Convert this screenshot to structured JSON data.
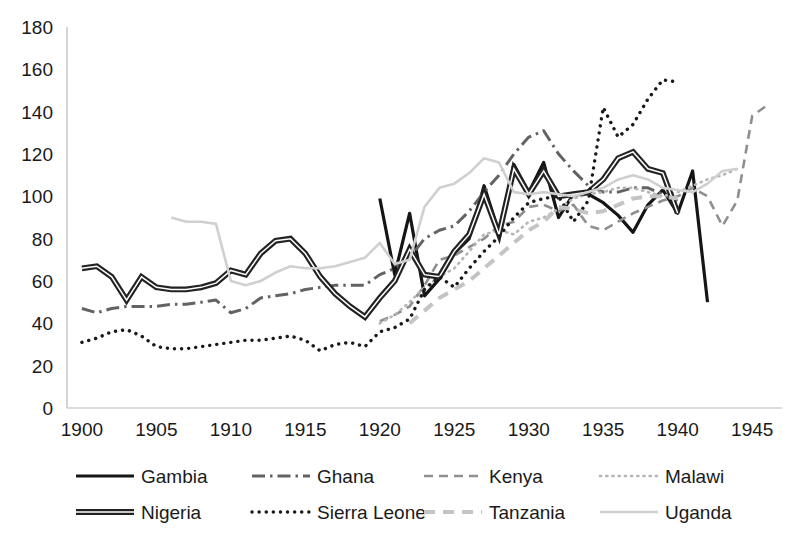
{
  "chart_data": {
    "type": "line",
    "title": "",
    "xlabel": "",
    "ylabel": "",
    "xlim": [
      1899,
      1947
    ],
    "ylim": [
      0,
      180
    ],
    "grid": false,
    "legend_position": "bottom",
    "x_ticks": [
      "1900",
      "1905",
      "1910",
      "1915",
      "1920",
      "1925",
      "1930",
      "1935",
      "1940",
      "1945"
    ],
    "y_ticks": [
      "0",
      "20",
      "40",
      "60",
      "80",
      "100",
      "120",
      "140",
      "160",
      "180"
    ],
    "series": [
      {
        "name": "Gambia",
        "style": "solid",
        "color": "#151515",
        "width": 3.2,
        "x": [
          1920,
          1921,
          1922,
          1923,
          1924,
          1925,
          1926,
          1927,
          1928,
          1929,
          1930,
          1931,
          1932,
          1933,
          1934,
          1935,
          1936,
          1937,
          1938,
          1939,
          1940,
          1941,
          1942
        ],
        "y": [
          99,
          63,
          92,
          53,
          61,
          73,
          80,
          105,
          83,
          115,
          102,
          116,
          90,
          101,
          101,
          97,
          91,
          83,
          96,
          103,
          92,
          112,
          50
        ]
      },
      {
        "name": "Ghana",
        "style": "dash-dot",
        "color": "#636363",
        "width": 3.0,
        "x": [
          1900,
          1901,
          1902,
          1903,
          1904,
          1905,
          1906,
          1907,
          1908,
          1909,
          1910,
          1911,
          1912,
          1913,
          1914,
          1915,
          1916,
          1917,
          1918,
          1919,
          1920,
          1921,
          1922,
          1923,
          1924,
          1925,
          1926,
          1927,
          1928,
          1929,
          1930,
          1931,
          1932,
          1933,
          1934,
          1935,
          1936,
          1937,
          1938,
          1939,
          1940
        ],
        "y": [
          47,
          45,
          47,
          48,
          48,
          48,
          49,
          49,
          50,
          51,
          45,
          47,
          52,
          53,
          54,
          56,
          57,
          58,
          58,
          58,
          63,
          66,
          71,
          80,
          84,
          86,
          93,
          102,
          110,
          120,
          128,
          131,
          120,
          112,
          105,
          102,
          102,
          104,
          104,
          101,
          98
        ]
      },
      {
        "name": "Kenya",
        "style": "dashed",
        "color": "#8f8f8f",
        "width": 2.6,
        "x": [
          1920,
          1921,
          1922,
          1923,
          1924,
          1925,
          1926,
          1927,
          1928,
          1929,
          1930,
          1931,
          1932,
          1933,
          1934,
          1935,
          1936,
          1937,
          1938,
          1939,
          1940,
          1941,
          1942,
          1943,
          1944,
          1945,
          1946
        ],
        "y": [
          41,
          44,
          48,
          58,
          70,
          72,
          76,
          80,
          86,
          88,
          95,
          96,
          93,
          96,
          86,
          84,
          88,
          92,
          95,
          98,
          100,
          104,
          100,
          86,
          98,
          138,
          143
        ]
      },
      {
        "name": "Malawi",
        "style": "dotted",
        "color": "#b5b5b5",
        "width": 2.6,
        "x": [
          1920,
          1921,
          1922,
          1923,
          1924,
          1925,
          1926,
          1927,
          1928,
          1929,
          1930,
          1931,
          1932,
          1933,
          1934,
          1935,
          1936,
          1937,
          1938,
          1939,
          1940,
          1941,
          1942,
          1943,
          1944
        ],
        "y": [
          40,
          44,
          50,
          57,
          62,
          66,
          74,
          82,
          84,
          82,
          88,
          90,
          94,
          99,
          101,
          102,
          104,
          104,
          102,
          100,
          102,
          105,
          108,
          110,
          113
        ]
      },
      {
        "name": "Nigeria",
        "style": "double",
        "color": "#222222",
        "width": 4.2,
        "x": [
          1900,
          1901,
          1902,
          1903,
          1904,
          1905,
          1906,
          1907,
          1908,
          1909,
          1910,
          1911,
          1912,
          1913,
          1914,
          1915,
          1916,
          1917,
          1918,
          1919,
          1920,
          1921,
          1922,
          1923,
          1924,
          1925,
          1926,
          1927,
          1928,
          1929,
          1930,
          1931,
          1932,
          1933,
          1934,
          1935,
          1936,
          1937,
          1938,
          1939,
          1940
        ],
        "y": [
          66,
          67,
          62,
          51,
          62,
          57,
          56,
          56,
          57,
          59,
          65,
          63,
          73,
          79,
          80,
          73,
          62,
          54,
          48,
          43,
          52,
          60,
          75,
          63,
          62,
          74,
          82,
          101,
          82,
          113,
          101,
          112,
          100,
          101,
          102,
          108,
          118,
          121,
          113,
          111,
          92
        ]
      },
      {
        "name": "Sierra Leone",
        "style": "dotted-bold",
        "color": "#1a1a1a",
        "width": 3.4,
        "x": [
          1900,
          1901,
          1902,
          1903,
          1904,
          1905,
          1906,
          1907,
          1908,
          1909,
          1910,
          1911,
          1912,
          1913,
          1914,
          1915,
          1916,
          1917,
          1918,
          1919,
          1920,
          1921,
          1922,
          1923,
          1924,
          1925,
          1926,
          1927,
          1928,
          1929,
          1930,
          1931,
          1932,
          1933,
          1934,
          1935,
          1936,
          1937,
          1938,
          1939,
          1940
        ],
        "y": [
          31,
          33,
          36,
          37,
          34,
          29,
          28,
          28,
          29,
          30,
          31,
          32,
          32,
          33,
          34,
          32,
          27,
          30,
          31,
          29,
          36,
          38,
          42,
          56,
          62,
          57,
          66,
          74,
          81,
          90,
          97,
          99,
          100,
          88,
          98,
          142,
          128,
          134,
          146,
          155,
          154
        ]
      },
      {
        "name": "Tanzania",
        "style": "dashed-light",
        "color": "#c4c4c4",
        "width": 4.0,
        "x": [
          1922,
          1923,
          1924,
          1925,
          1926,
          1927,
          1928,
          1929,
          1930,
          1931,
          1932,
          1933,
          1934,
          1935,
          1936,
          1937,
          1938,
          1939,
          1940
        ],
        "y": [
          40,
          46,
          52,
          56,
          60,
          66,
          72,
          78,
          84,
          88,
          95,
          94,
          92,
          93,
          96,
          99,
          100,
          100,
          99
        ]
      },
      {
        "name": "Uganda",
        "style": "solid-light",
        "color": "#d0d0d0",
        "width": 2.6,
        "x": [
          1906,
          1907,
          1908,
          1909,
          1910,
          1911,
          1912,
          1913,
          1914,
          1915,
          1916,
          1917,
          1918,
          1919,
          1920,
          1921,
          1922,
          1923,
          1924,
          1925,
          1926,
          1927,
          1928,
          1929,
          1930,
          1931,
          1932,
          1933,
          1934,
          1935,
          1936,
          1937,
          1938,
          1939,
          1940,
          1941,
          1942,
          1943,
          1944
        ],
        "y": [
          90,
          88,
          88,
          87,
          60,
          58,
          60,
          64,
          67,
          66,
          66,
          67,
          69,
          71,
          78,
          68,
          70,
          95,
          104,
          106,
          111,
          118,
          116,
          102,
          101,
          102,
          101,
          100,
          102,
          104,
          108,
          110,
          108,
          104,
          103,
          102,
          106,
          112,
          113
        ]
      }
    ]
  },
  "legend": {
    "rows": [
      [
        {
          "label": "Gambia",
          "swatch": "solid"
        },
        {
          "label": "Ghana",
          "swatch": "dash-dot"
        },
        {
          "label": "Kenya",
          "swatch": "dashed"
        },
        {
          "label": "Malawi",
          "swatch": "dotted"
        }
      ],
      [
        {
          "label": "Nigeria",
          "swatch": "double"
        },
        {
          "label": "Sierra Leone",
          "swatch": "dotted-bold"
        },
        {
          "label": "Tanzania",
          "swatch": "dashed-light"
        },
        {
          "label": "Uganda",
          "swatch": "solid-light"
        }
      ]
    ]
  }
}
